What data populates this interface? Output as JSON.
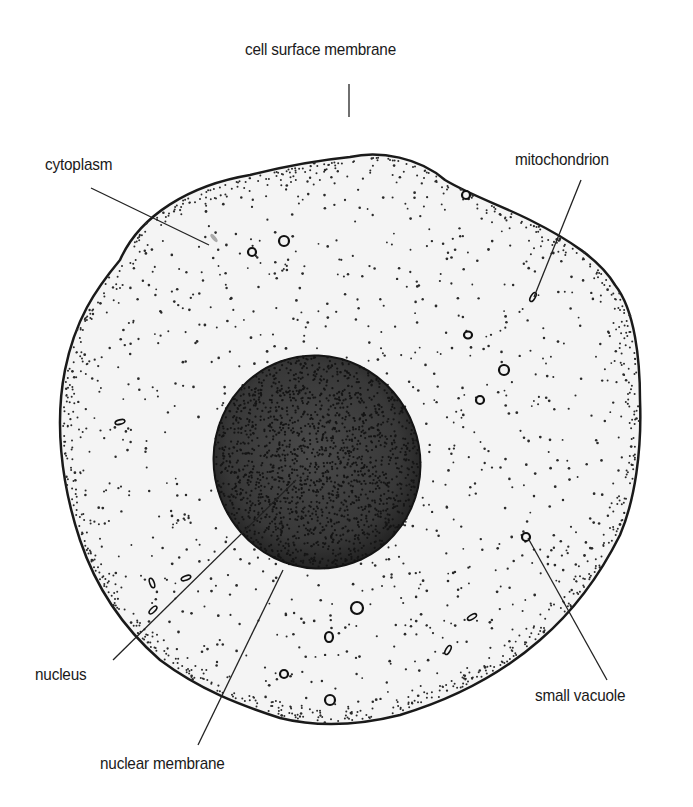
{
  "diagram": {
    "colors": {
      "background": "#ffffff",
      "cytoplasm": "#f3f3f3",
      "outline": "#1a1a1a",
      "nucleus": "#3a3a3a",
      "nucleus_edge": "#141414",
      "stipple": "#2a2a2a"
    },
    "labels": [
      {
        "id": "cell-surface-membrane",
        "text": "cell surface membrane",
        "x": 245,
        "y": 50,
        "pointer": [
          [
            349,
            84
          ],
          [
            349,
            117
          ]
        ]
      },
      {
        "id": "cytoplasm",
        "text": "cytoplasm",
        "x": 45,
        "y": 155,
        "pointer": [
          [
            91,
            188
          ],
          [
            209,
            245
          ]
        ]
      },
      {
        "id": "mitochondrion",
        "text": "mitochondrion",
        "x": 515,
        "y": 150,
        "pointer": [
          [
            581,
            180
          ],
          [
            534,
            297
          ]
        ]
      },
      {
        "id": "nucleus",
        "text": "nucleus",
        "x": 35,
        "y": 665,
        "pointer": [
          [
            113,
            660
          ],
          [
            296,
            480
          ]
        ]
      },
      {
        "id": "small-vacuole",
        "text": "small vacuole",
        "x": 535,
        "y": 685,
        "pointer": [
          [
            607,
            680
          ],
          [
            528,
            538
          ]
        ]
      },
      {
        "id": "nuclear-membrane",
        "text": "nuclear membrane",
        "x": 100,
        "y": 755,
        "pointer": [
          [
            198,
            745
          ],
          [
            283,
            570
          ]
        ]
      }
    ]
  }
}
